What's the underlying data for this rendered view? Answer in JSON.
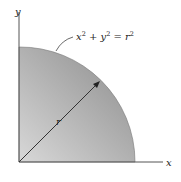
{
  "diagram": {
    "axes": {
      "x_label": "x",
      "y_label": "y"
    },
    "equation": {
      "base": "x",
      "sup1": "2",
      "plus": " + y",
      "sup2": "2",
      "eq": " = r",
      "sup3": "2"
    },
    "radius_label": "r",
    "colors": {
      "fill_light": "#d4d4d4",
      "fill_dark": "#8e8e8e",
      "axis": "#555555",
      "line": "#333333"
    }
  }
}
